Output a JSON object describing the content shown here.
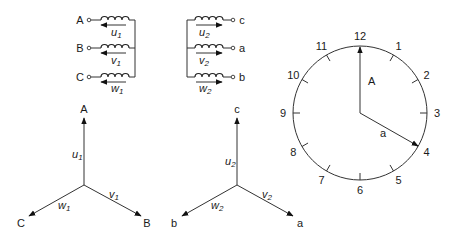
{
  "primary_windings": {
    "items": [
      {
        "terminal": "A",
        "winding": "u",
        "sub": "1"
      },
      {
        "terminal": "B",
        "winding": "v",
        "sub": "1"
      },
      {
        "terminal": "C",
        "winding": "w",
        "sub": "1"
      }
    ]
  },
  "secondary_windings": {
    "items": [
      {
        "terminal": "c",
        "winding": "u",
        "sub": "2"
      },
      {
        "terminal": "a",
        "winding": "v",
        "sub": "2"
      },
      {
        "terminal": "b",
        "winding": "w",
        "sub": "2"
      }
    ]
  },
  "primary_phasor": {
    "tips": {
      "up": "A",
      "left": "C",
      "right": "B"
    },
    "labels": {
      "up": {
        "w": "u",
        "s": "1"
      },
      "right": {
        "w": "v",
        "s": "1"
      },
      "left": {
        "w": "w",
        "s": "1"
      }
    }
  },
  "secondary_phasor": {
    "tips": {
      "up": "c",
      "left": "b",
      "right": "a"
    },
    "labels": {
      "up": {
        "w": "u",
        "s": "2"
      },
      "right": {
        "w": "v",
        "s": "2"
      },
      "left": {
        "w": "w",
        "s": "2"
      }
    }
  },
  "clock": {
    "numbers": [
      "12",
      "1",
      "2",
      "3",
      "4",
      "5",
      "6",
      "7",
      "8",
      "9",
      "10",
      "11"
    ],
    "hand_long_label": "A",
    "hand_short_label": "a",
    "hand_long_points_to": "12",
    "hand_short_points_to": "4"
  },
  "colors": {
    "ink": "#333333",
    "background": "#ffffff"
  }
}
